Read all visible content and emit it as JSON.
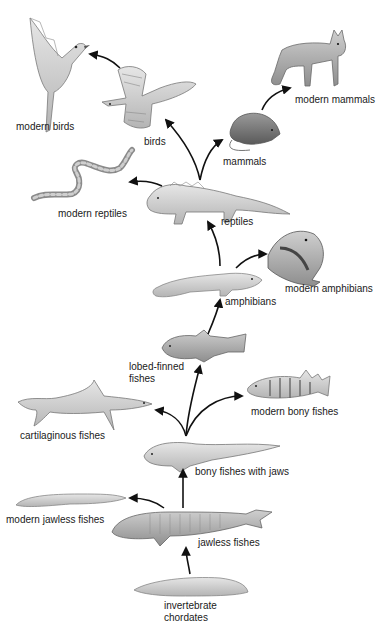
{
  "diagram": {
    "type": "evolutionary-tree",
    "nodes": [
      {
        "id": "invertebrate-chordates",
        "label": "invertebrate\nchordates",
        "line1": "invertebrate",
        "line2": "chordates"
      },
      {
        "id": "jawless-fishes",
        "label": "jawless fishes"
      },
      {
        "id": "modern-jawless-fishes",
        "label": "modern jawless fishes"
      },
      {
        "id": "bony-fishes-with-jaws",
        "label": "bony fishes with jaws"
      },
      {
        "id": "cartilaginous-fishes",
        "label": "cartilaginous fishes"
      },
      {
        "id": "lobed-finned-fishes",
        "label": "lobed-finned\nfishes",
        "line1": "lobed-finned",
        "line2": "fishes"
      },
      {
        "id": "modern-bony-fishes",
        "label": "modern bony fishes"
      },
      {
        "id": "amphibians",
        "label": "amphibians"
      },
      {
        "id": "modern-amphibians",
        "label": "modern amphibians"
      },
      {
        "id": "reptiles",
        "label": "reptiles"
      },
      {
        "id": "modern-reptiles",
        "label": "modern reptiles"
      },
      {
        "id": "birds",
        "label": "birds"
      },
      {
        "id": "modern-birds",
        "label": "modern birds"
      },
      {
        "id": "mammals",
        "label": "mammals"
      },
      {
        "id": "modern-mammals",
        "label": "modern mammals"
      }
    ],
    "edges": [
      {
        "from": "invertebrate-chordates",
        "to": "jawless-fishes"
      },
      {
        "from": "jawless-fishes",
        "to": "modern-jawless-fishes"
      },
      {
        "from": "jawless-fishes",
        "to": "bony-fishes-with-jaws"
      },
      {
        "from": "bony-fishes-with-jaws",
        "to": "cartilaginous-fishes"
      },
      {
        "from": "bony-fishes-with-jaws",
        "to": "lobed-finned-fishes"
      },
      {
        "from": "bony-fishes-with-jaws",
        "to": "modern-bony-fishes"
      },
      {
        "from": "lobed-finned-fishes",
        "to": "amphibians"
      },
      {
        "from": "amphibians",
        "to": "modern-amphibians"
      },
      {
        "from": "amphibians",
        "to": "reptiles"
      },
      {
        "from": "reptiles",
        "to": "modern-reptiles"
      },
      {
        "from": "reptiles",
        "to": "birds"
      },
      {
        "from": "reptiles",
        "to": "mammals"
      },
      {
        "from": "birds",
        "to": "modern-birds"
      },
      {
        "from": "mammals",
        "to": "modern-mammals"
      }
    ]
  },
  "labels": {
    "modern_birds": "modern birds",
    "birds": "birds",
    "modern_mammals": "modern mammals",
    "mammals": "mammals",
    "modern_reptiles": "modern reptiles",
    "reptiles": "reptiles",
    "modern_amphibians": "modern amphibians",
    "amphibians": "amphibians",
    "lobed_finned_1": "lobed-finned",
    "lobed_finned_2": "fishes",
    "modern_bony_fishes": "modern bony fishes",
    "cartilaginous_fishes": "cartilaginous fishes",
    "bony_fishes_with_jaws": "bony fishes with jaws",
    "modern_jawless_fishes": "modern jawless fishes",
    "jawless_fishes": "jawless fishes",
    "invertebrate_1": "invertebrate",
    "invertebrate_2": "chordates"
  },
  "colors": {
    "ink": "#1a1a1a",
    "drawing_dark": "#6b6b6b",
    "drawing_mid": "#a8a8a8",
    "drawing_light": "#d6d6d6",
    "background": "#ffffff"
  }
}
